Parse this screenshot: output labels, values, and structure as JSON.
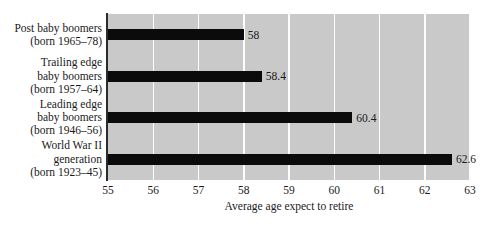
{
  "chart_data": {
    "type": "bar",
    "orientation": "horizontal",
    "title": "",
    "xlabel": "Average age expect to retire",
    "ylabel": "",
    "xlim": [
      55,
      63
    ],
    "xticks": [
      55,
      56,
      57,
      58,
      59,
      60,
      61,
      62,
      63
    ],
    "grid": "vertical-white",
    "legend": "none",
    "plot_background": "#c9c9c9",
    "bar_color": "#0b0b0b",
    "categories": [
      "Post baby boomers\n(born 1965–78)",
      "Trailing edge\nbaby boomers\n(born 1957–64)",
      "Leading edge\nbaby boomers\n(born 1946–56)",
      "World War II\ngeneration\n(born 1923–45)"
    ],
    "values": [
      58,
      58.4,
      60.4,
      62.6
    ],
    "value_labels": [
      "58",
      "58.4",
      "60.4",
      "62.6"
    ]
  }
}
